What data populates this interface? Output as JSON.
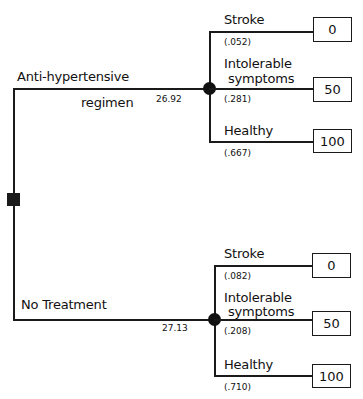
{
  "decision_node": {
    "icon": "decision-square-icon"
  },
  "branches": [
    {
      "label_line1": "Anti-hypertensive",
      "label_line2": "regimen",
      "expected_value": "26.92",
      "outcomes": [
        {
          "label": "Stroke",
          "probability": "(.052)",
          "utility": "0"
        },
        {
          "label_line1": "Intolerable",
          "label_line2": "symptoms",
          "probability": "(.281)",
          "utility": "50"
        },
        {
          "label": "Healthy",
          "probability": "(.667)",
          "utility": "100"
        }
      ]
    },
    {
      "label_line1": "No Treatment",
      "expected_value": "27.13",
      "outcomes": [
        {
          "label": "Stroke",
          "probability": "(.082)",
          "utility": "0"
        },
        {
          "label_line1": "Intolerable",
          "label_line2": "symptoms",
          "probability": "(.208)",
          "utility": "50"
        },
        {
          "label": "Healthy",
          "probability": "(.710)",
          "utility": "100"
        }
      ]
    }
  ]
}
